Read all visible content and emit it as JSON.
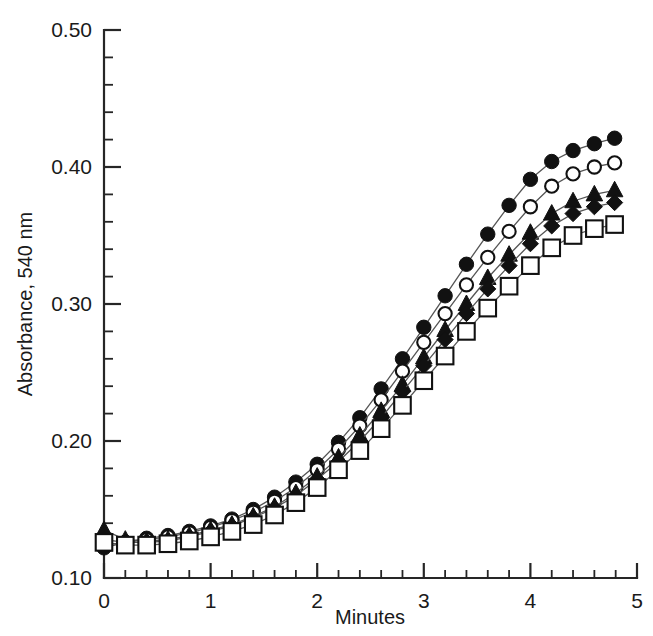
{
  "chart_data": {
    "type": "line",
    "title": "",
    "xlabel": "Minutes",
    "ylabel": "Absorbance, 540 nm",
    "xlim": [
      0,
      5
    ],
    "ylim": [
      0.1,
      0.5
    ],
    "grid": false,
    "legend": "none",
    "x_ticks": [
      "0",
      "1",
      "2",
      "3",
      "4",
      "5"
    ],
    "x_tick_values": [
      0,
      1,
      2,
      3,
      4,
      5
    ],
    "x_minor_step": 0.2,
    "y_ticks": [
      "0.10",
      "0.20",
      "0.30",
      "0.40",
      "0.50"
    ],
    "y_tick_values": [
      0.1,
      0.2,
      0.3,
      0.4,
      0.5
    ],
    "y_minor_step": 0.02,
    "x": [
      0,
      0.2,
      0.4,
      0.6,
      0.8,
      1.0,
      1.2,
      1.4,
      1.6,
      1.8,
      2.0,
      2.2,
      2.4,
      2.6,
      2.8,
      3.0,
      3.2,
      3.4,
      3.6,
      3.8,
      4.0,
      4.2,
      4.4,
      4.6,
      4.79
    ],
    "series": [
      {
        "name": "series-filled-circle",
        "marker": "filled-circle",
        "color": "#111111",
        "values": [
          0.122,
          0.126,
          0.129,
          0.131,
          0.134,
          0.138,
          0.143,
          0.15,
          0.159,
          0.17,
          0.183,
          0.199,
          0.217,
          0.238,
          0.26,
          0.283,
          0.306,
          0.329,
          0.351,
          0.372,
          0.391,
          0.404,
          0.412,
          0.417,
          0.421
        ]
      },
      {
        "name": "series-open-circle",
        "marker": "open-circle",
        "color": "#111111",
        "values": [
          0.124,
          0.126,
          0.128,
          0.13,
          0.133,
          0.137,
          0.142,
          0.148,
          0.156,
          0.166,
          0.179,
          0.194,
          0.211,
          0.23,
          0.251,
          0.272,
          0.293,
          0.314,
          0.334,
          0.353,
          0.371,
          0.386,
          0.395,
          0.4,
          0.403
        ]
      },
      {
        "name": "series-filled-triangle",
        "marker": "filled-triangle",
        "color": "#111111",
        "values": [
          0.135,
          0.128,
          0.127,
          0.128,
          0.131,
          0.135,
          0.139,
          0.145,
          0.152,
          0.162,
          0.174,
          0.188,
          0.204,
          0.222,
          0.241,
          0.261,
          0.281,
          0.3,
          0.319,
          0.336,
          0.352,
          0.366,
          0.375,
          0.38,
          0.383
        ]
      },
      {
        "name": "series-filled-diamond",
        "marker": "filled-diamond",
        "color": "#111111",
        "values": [
          0.128,
          0.126,
          0.126,
          0.127,
          0.13,
          0.134,
          0.138,
          0.144,
          0.151,
          0.16,
          0.172,
          0.185,
          0.2,
          0.217,
          0.236,
          0.255,
          0.274,
          0.293,
          0.311,
          0.328,
          0.344,
          0.357,
          0.366,
          0.371,
          0.374
        ]
      },
      {
        "name": "series-open-square",
        "marker": "open-square",
        "color": "#111111",
        "values": [
          0.126,
          0.124,
          0.124,
          0.125,
          0.127,
          0.13,
          0.134,
          0.139,
          0.146,
          0.155,
          0.166,
          0.179,
          0.193,
          0.209,
          0.226,
          0.244,
          0.262,
          0.28,
          0.297,
          0.313,
          0.328,
          0.341,
          0.35,
          0.355,
          0.358
        ]
      }
    ]
  },
  "axes": {
    "x_title": "Minutes",
    "y_title": "Absorbance, 540 nm"
  }
}
